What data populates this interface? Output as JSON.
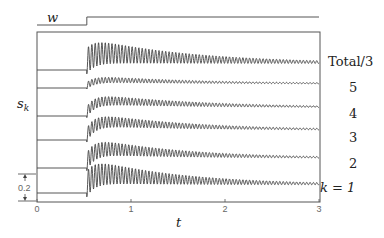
{
  "chart_data": {
    "type": "line",
    "title": "",
    "xlabel": "t",
    "ylabel": "s_k",
    "xlim": [
      0,
      3
    ],
    "x_ticks": [
      "0",
      "1",
      "2",
      "3"
    ],
    "grid": false,
    "input_signal": {
      "label": "w",
      "type": "step",
      "step_time": 0.53,
      "low_level": 0,
      "high_level": 1
    },
    "scale_bar": {
      "label": "0.2",
      "value": 0.2
    },
    "step_time": 0.53,
    "oscillation_freq_per_unit_t": 28,
    "series": [
      {
        "name": "Total/3",
        "offset_rank": 6,
        "initial_amplitude": 0.19,
        "mean_shift": 0.08,
        "decay_rate": 0.9
      },
      {
        "name": "5",
        "offset_rank": 5,
        "initial_amplitude": 0.05,
        "mean_shift": 0.05,
        "decay_rate": 0.8
      },
      {
        "name": "4",
        "offset_rank": 4,
        "initial_amplitude": 0.08,
        "mean_shift": 0.1,
        "decay_rate": 0.8
      },
      {
        "name": "3",
        "offset_rank": 3,
        "initial_amplitude": 0.1,
        "mean_shift": 0.12,
        "decay_rate": 0.9
      },
      {
        "name": "2",
        "offset_rank": 2,
        "initial_amplitude": 0.13,
        "mean_shift": 0.12,
        "decay_rate": 1.0
      },
      {
        "name": "k = 1",
        "offset_rank": 1,
        "initial_amplitude": 0.19,
        "mean_shift": 0.1,
        "decay_rate": 1.0
      }
    ],
    "legend_position": "right, inline with each trace"
  },
  "labels": {
    "w": "w",
    "sk_main": "s",
    "sk_sub": "k",
    "t": "t",
    "scale": "0.2",
    "series_labels": [
      "Total/3",
      "5",
      "4",
      "3",
      "2",
      "k = 1"
    ]
  }
}
